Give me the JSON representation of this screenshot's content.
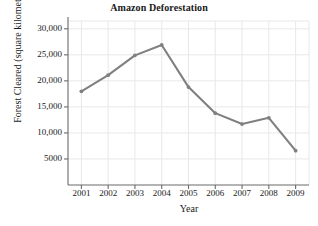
{
  "chart_data": {
    "type": "line",
    "title": "Amazon Deforestation",
    "xlabel": "Year",
    "ylabel": "Forest Cleared (square kilometers)",
    "categories": [
      "2001",
      "2002",
      "2003",
      "2004",
      "2005",
      "2006",
      "2007",
      "2008",
      "2009"
    ],
    "x": [
      2001,
      2002,
      2003,
      2004,
      2005,
      2006,
      2007,
      2008,
      2009
    ],
    "values": [
      18000,
      21100,
      24900,
      26900,
      18800,
      13800,
      11700,
      12900,
      6600
    ],
    "series": [
      {
        "name": "Forest Cleared",
        "values": [
          18000,
          21100,
          24900,
          26900,
          18800,
          13800,
          11700,
          12900,
          6600
        ]
      }
    ],
    "xlim": [
      2000.5,
      2009.5
    ],
    "ylim": [
      0,
      31500
    ],
    "ytick_values": [
      5000,
      10000,
      15000,
      20000,
      25000,
      30000
    ],
    "ytick_labels": [
      "5000",
      "10,000",
      "15,000",
      "20,000",
      "25,000",
      "30,000"
    ],
    "xtick_labels": [
      "2001",
      "2002",
      "2003",
      "2004",
      "2005",
      "2006",
      "2007",
      "2008",
      "2009"
    ],
    "grid": true,
    "legend": false,
    "legend_position": "none",
    "line_color": "#808080",
    "marker_color": "#808080",
    "grid_color": "#e8e8e8",
    "axis_color": "#6b6b6b",
    "text_color": "#1a1a1a",
    "background_color": "#ffffff"
  }
}
